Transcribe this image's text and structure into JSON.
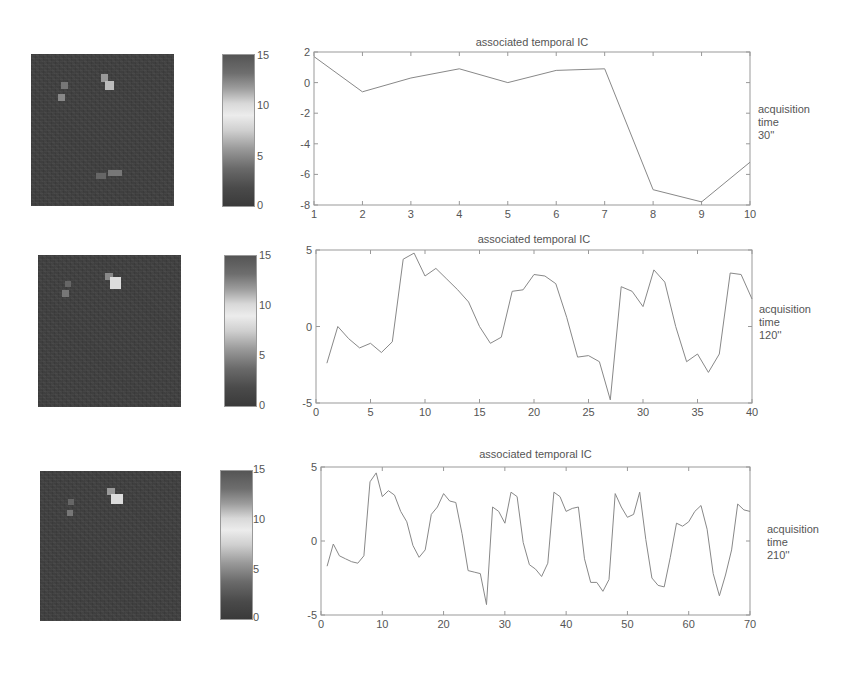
{
  "figure": {
    "rows": [
      {
        "chart_title": "associated temporal IC",
        "side_label": {
          "line1": "acquisition",
          "line2": "time",
          "line3": "30''"
        },
        "colorbar": {
          "ticks": [
            "15",
            "10",
            "5",
            "0"
          ],
          "min": 0,
          "max": 15
        }
      },
      {
        "chart_title": "associated temporal IC",
        "side_label": {
          "line1": "acquisition",
          "line2": "time",
          "line3": "120''"
        },
        "colorbar": {
          "ticks": [
            "15",
            "10",
            "5",
            "0"
          ],
          "min": 0,
          "max": 15
        }
      },
      {
        "chart_title": "associated temporal IC",
        "side_label": {
          "line1": "acquisition",
          "line2": "time",
          "line3": "210''"
        },
        "colorbar": {
          "ticks": [
            "15",
            "10",
            "5",
            "0"
          ],
          "min": 0,
          "max": 15
        }
      }
    ]
  },
  "chart_data": [
    {
      "type": "line",
      "title": "associated temporal IC",
      "side_label": "acquisition time 30''",
      "xlabel": "",
      "ylabel": "",
      "xlim": [
        1,
        10
      ],
      "ylim": [
        -8,
        2
      ],
      "xticks": [
        1,
        2,
        3,
        4,
        5,
        6,
        7,
        8,
        9,
        10
      ],
      "yticks": [
        -8,
        -6,
        -4,
        -2,
        0,
        2
      ],
      "grid": false,
      "x": [
        1,
        2,
        3,
        4,
        5,
        6,
        7,
        8,
        9,
        10
      ],
      "values": [
        1.7,
        -0.6,
        0.3,
        0.9,
        0.0,
        0.8,
        0.9,
        -7.0,
        -7.8,
        -5.2
      ]
    },
    {
      "type": "line",
      "title": "associated temporal IC",
      "side_label": "acquisition time 120''",
      "xlabel": "",
      "ylabel": "",
      "xlim": [
        0,
        40
      ],
      "ylim": [
        -5,
        5
      ],
      "xticks": [
        0,
        5,
        10,
        15,
        20,
        25,
        30,
        35,
        40
      ],
      "yticks": [
        -5,
        0,
        5
      ],
      "grid": false,
      "x": [
        1,
        2,
        3,
        4,
        5,
        6,
        7,
        8,
        9,
        10,
        11,
        12,
        13,
        14,
        15,
        16,
        17,
        18,
        19,
        20,
        21,
        22,
        23,
        24,
        25,
        26,
        27,
        28,
        29,
        30,
        31,
        32,
        33,
        34,
        35,
        36,
        37,
        38,
        39,
        40
      ],
      "values": [
        -2.4,
        0.0,
        -0.8,
        -1.4,
        -1.1,
        -1.7,
        -1.0,
        4.4,
        4.8,
        3.3,
        3.8,
        3.1,
        2.4,
        1.6,
        0.0,
        -1.1,
        -0.7,
        2.3,
        2.4,
        3.4,
        3.3,
        2.8,
        0.6,
        -2.0,
        -1.9,
        -2.3,
        -4.8,
        2.6,
        2.3,
        1.3,
        3.7,
        2.9,
        0.0,
        -2.3,
        -1.8,
        -3.0,
        -1.8,
        3.5,
        3.4,
        1.8
      ]
    },
    {
      "type": "line",
      "title": "associated temporal IC",
      "side_label": "acquisition time 210''",
      "xlabel": "",
      "ylabel": "",
      "xlim": [
        0,
        70
      ],
      "ylim": [
        -5,
        5
      ],
      "xticks": [
        0,
        10,
        20,
        30,
        40,
        50,
        60,
        70
      ],
      "yticks": [
        -5,
        0,
        5
      ],
      "grid": false,
      "x": [
        1,
        2,
        3,
        4,
        5,
        6,
        7,
        8,
        9,
        10,
        11,
        12,
        13,
        14,
        15,
        16,
        17,
        18,
        19,
        20,
        21,
        22,
        23,
        24,
        25,
        26,
        27,
        28,
        29,
        30,
        31,
        32,
        33,
        34,
        35,
        36,
        37,
        38,
        39,
        40,
        41,
        42,
        43,
        44,
        45,
        46,
        47,
        48,
        49,
        50,
        51,
        52,
        53,
        54,
        55,
        56,
        57,
        58,
        59,
        60,
        61,
        62,
        63,
        64,
        65,
        66,
        67,
        68,
        69,
        70
      ],
      "values": [
        -1.7,
        -0.2,
        -1.0,
        -1.2,
        -1.4,
        -1.5,
        -1.0,
        4.0,
        4.6,
        3.0,
        3.4,
        3.1,
        2.0,
        1.3,
        -0.3,
        -1.1,
        -0.6,
        1.8,
        2.3,
        3.2,
        2.7,
        2.6,
        0.5,
        -2.0,
        -2.1,
        -2.2,
        -4.3,
        2.3,
        2.0,
        1.2,
        3.3,
        3.0,
        -0.1,
        -1.6,
        -1.9,
        -2.4,
        -1.5,
        3.3,
        3.0,
        2.0,
        2.2,
        2.3,
        -1.2,
        -2.8,
        -2.8,
        -3.4,
        -2.6,
        3.2,
        2.3,
        1.6,
        1.8,
        3.3,
        0.1,
        -2.5,
        -3.0,
        -3.1,
        -1.1,
        1.2,
        1.0,
        1.3,
        2.0,
        2.4,
        0.8,
        -2.2,
        -3.7,
        -2.3,
        -0.6,
        2.5,
        2.1,
        2.0
      ]
    }
  ]
}
